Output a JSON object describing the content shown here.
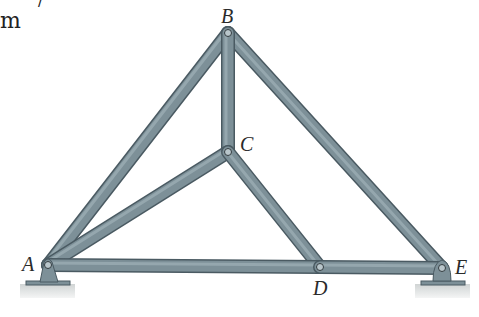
{
  "fragments": {
    "top_left": "m",
    "top_mark": "/"
  },
  "joints": {
    "A": {
      "label": "A",
      "x": 48,
      "y": 265
    },
    "B": {
      "label": "B",
      "x": 228,
      "y": 33
    },
    "C": {
      "label": "C",
      "x": 228,
      "y": 152
    },
    "D": {
      "label": "D",
      "x": 320,
      "y": 267
    },
    "E": {
      "label": "E",
      "x": 442,
      "y": 268
    }
  },
  "members": [
    [
      "A",
      "B"
    ],
    [
      "B",
      "E"
    ],
    [
      "B",
      "C"
    ],
    [
      "A",
      "C"
    ],
    [
      "C",
      "D"
    ],
    [
      "A",
      "D"
    ],
    [
      "D",
      "E"
    ]
  ],
  "supports": [
    {
      "joint": "A",
      "type": "pin"
    },
    {
      "joint": "E",
      "type": "roller"
    }
  ],
  "colors": {
    "member_fill": "#7d9098",
    "member_edge": "#4a5a62",
    "member_highlight": "#a9bac1",
    "ground": "#d9dcdc"
  }
}
